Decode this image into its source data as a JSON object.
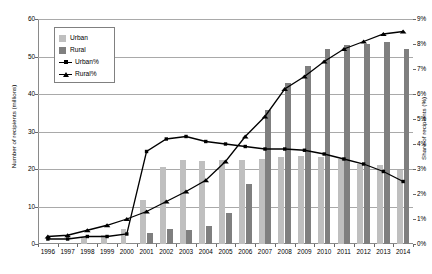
{
  "chart_data": {
    "type": "bar",
    "title": "",
    "subtitle": "",
    "categories": [
      "1996",
      "1997",
      "1998",
      "1999",
      "2000",
      "2001",
      "2002",
      "2003",
      "2004",
      "2005",
      "2006",
      "2007",
      "2008",
      "2009",
      "2010",
      "2011",
      "2012",
      "2013",
      "2014"
    ],
    "xlabel": "",
    "ylabel": "Number of recipients (millions)",
    "ylabel_right": "Share of recipients (%)",
    "ylim": [
      0,
      60
    ],
    "yticks": [
      0,
      10,
      20,
      30,
      40,
      50,
      60
    ],
    "ytick_labels": [
      "0",
      "10",
      "20",
      "30",
      "40",
      "50",
      "60"
    ],
    "ylim_right": [
      0,
      9
    ],
    "yticks_right": [
      0,
      1,
      2,
      3,
      4,
      5,
      6,
      7,
      8,
      9
    ],
    "ytick_labels_right": [
      "0%",
      "1%",
      "2%",
      "3%",
      "4%",
      "5%",
      "6%",
      "7%",
      "8%",
      "9%"
    ],
    "grid": true,
    "legend_position": "upper-left",
    "series": [
      {
        "name": "Urban",
        "type": "bar",
        "axis": "left",
        "color": "#bfbfbf",
        "values": [
          0.0,
          0.0,
          1.8,
          2.4,
          4.0,
          11.7,
          20.6,
          22.5,
          22.1,
          22.3,
          22.4,
          22.7,
          23.3,
          23.5,
          23.1,
          22.8,
          21.4,
          21.0,
          19.8
        ]
      },
      {
        "name": "Rural",
        "type": "bar",
        "axis": "left",
        "color": "#7f7f7f",
        "values": [
          0.0,
          0.0,
          0.0,
          0.0,
          0.0,
          3.0,
          4.1,
          3.7,
          4.9,
          8.3,
          15.9,
          35.7,
          42.9,
          47.6,
          52.1,
          53.1,
          53.4,
          53.9,
          52.1
        ]
      },
      {
        "name": "Urban%",
        "type": "line",
        "axis": "right",
        "color": "#000000",
        "marker": "square",
        "values": [
          0.2,
          0.2,
          0.3,
          0.3,
          0.4,
          3.7,
          4.2,
          4.3,
          4.1,
          4.0,
          3.9,
          3.8,
          3.8,
          3.75,
          3.6,
          3.4,
          3.2,
          2.9,
          2.5
        ]
      },
      {
        "name": "Rural%",
        "type": "line",
        "axis": "right",
        "color": "#000000",
        "marker": "triangle",
        "values": [
          0.3,
          0.35,
          0.55,
          0.75,
          1.0,
          1.3,
          1.7,
          2.1,
          2.55,
          3.3,
          4.3,
          5.1,
          6.2,
          6.7,
          7.3,
          7.8,
          8.1,
          8.4,
          8.5
        ]
      }
    ]
  },
  "legend": {
    "entries": [
      {
        "label": "Urban",
        "swatch": "urban-swatch"
      },
      {
        "label": "Rural",
        "swatch": "rural-swatch"
      },
      {
        "label": "Urban%",
        "swatch": "urban-line-marker"
      },
      {
        "label": "Rural%",
        "swatch": "rural-line-marker"
      }
    ]
  },
  "colors": {
    "urban_bar": "#bfbfbf",
    "rural_bar": "#7f7f7f",
    "line": "#000000",
    "grid": "#a9a9a9",
    "axis": "#8a8a8a",
    "background": "#ffffff"
  }
}
